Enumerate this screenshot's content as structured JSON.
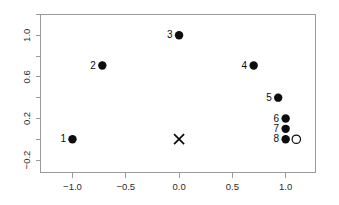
{
  "chart_data": {
    "type": "scatter",
    "title": "",
    "subtitle": "",
    "xlabel": "",
    "ylabel": "",
    "xlim": [
      -1.3,
      1.28
    ],
    "ylim": [
      -0.32,
      1.2
    ],
    "grid": false,
    "legend": "none",
    "xticks": [
      -1.0,
      -0.5,
      0.0,
      0.5,
      1.0
    ],
    "xticklabels": [
      "-1.0",
      "-0.5",
      "0.0",
      "0.5",
      "1.0"
    ],
    "yticks": [
      -0.2,
      0.2,
      0.6,
      1.0
    ],
    "yticklabels": [
      "-0.2",
      "0.2",
      "0.6",
      "1.0"
    ],
    "yminorticks": [
      0.0,
      0.4,
      0.8,
      1.2
    ],
    "series": [
      {
        "name": "labeled-points",
        "marker": "filled-circle",
        "points": [
          {
            "label": "1",
            "x": -1.0,
            "y": 0.0
          },
          {
            "label": "2",
            "x": -0.72,
            "y": 0.71
          },
          {
            "label": "3",
            "x": 0.0,
            "y": 1.0
          },
          {
            "label": "4",
            "x": 0.7,
            "y": 0.71
          },
          {
            "label": "5",
            "x": 0.93,
            "y": 0.4
          },
          {
            "label": "6",
            "x": 1.0,
            "y": 0.2
          },
          {
            "label": "7",
            "x": 1.0,
            "y": 0.1
          },
          {
            "label": "8",
            "x": 1.0,
            "y": 0.0
          }
        ]
      },
      {
        "name": "open-circle-point",
        "marker": "open-circle",
        "points": [
          {
            "label": "",
            "x": 1.1,
            "y": 0.0
          }
        ]
      },
      {
        "name": "cross-marker",
        "marker": "cross",
        "points": [
          {
            "label": "",
            "x": 0.0,
            "y": 0.0
          }
        ]
      }
    ]
  },
  "colors": {
    "marker": "#0d0d0d",
    "frame": "#9a9a9a",
    "text": "#2b2b2b",
    "background": "#ffffff"
  }
}
